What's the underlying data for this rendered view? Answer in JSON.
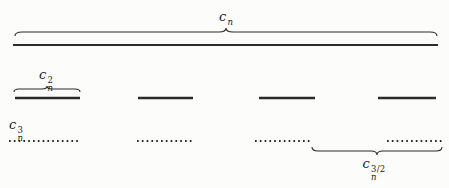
{
  "figure": {
    "background": "#fcfcfb",
    "ink": "#2b2b2b",
    "label_color": "#1a1a1a"
  },
  "labels": {
    "cn": {
      "base": "c",
      "sub": "n",
      "sup": "",
      "pos": {
        "x": 226,
        "y": 10,
        "anchor": "center"
      }
    },
    "cn2": {
      "base": "c",
      "sub": "n",
      "sup": "2",
      "pos": {
        "x": 46,
        "y": 68,
        "anchor": "center"
      }
    },
    "cn3": {
      "base": "c",
      "sub": "n",
      "sup": "3",
      "pos": {
        "x": 9,
        "y": 118,
        "anchor": "left"
      }
    },
    "cn32": {
      "base": "c",
      "sub": "n",
      "sup": "3/2",
      "pos": {
        "x": 374,
        "y": 157,
        "anchor": "center"
      }
    }
  },
  "diagram": {
    "width": 449,
    "height": 188,
    "top_line": {
      "x1": 13,
      "x2": 438,
      "y": 45,
      "thickness": 2.2
    },
    "solid_thickness": 2.4,
    "dotted_thickness": 2,
    "dot_dash": "1.7 3.1",
    "solid_segments": [
      {
        "x1": 15,
        "x2": 80,
        "y": 98
      },
      {
        "x1": 138,
        "x2": 193,
        "y": 98
      },
      {
        "x1": 259,
        "x2": 315,
        "y": 98
      },
      {
        "x1": 378,
        "x2": 436,
        "y": 98
      }
    ],
    "dotted_segments": [
      {
        "x1": 9,
        "x2": 80,
        "y": 141
      },
      {
        "x1": 137,
        "x2": 192,
        "y": 141
      },
      {
        "x1": 255,
        "x2": 312,
        "y": 141
      },
      {
        "x1": 387,
        "x2": 442,
        "y": 141
      }
    ],
    "braces": [
      {
        "name": "cn-overbrace",
        "x1": 15,
        "x2": 437,
        "y": 32,
        "dir": "over",
        "tip": 4,
        "shoulder": 7
      },
      {
        "name": "cn2-overbrace",
        "x1": 14,
        "x2": 80,
        "y": 89,
        "dir": "over",
        "tip": 3,
        "shoulder": 5
      },
      {
        "name": "cn32-underbrace",
        "x1": 312,
        "x2": 442,
        "y": 151,
        "dir": "under",
        "tip": 4,
        "shoulder": 6
      }
    ]
  }
}
